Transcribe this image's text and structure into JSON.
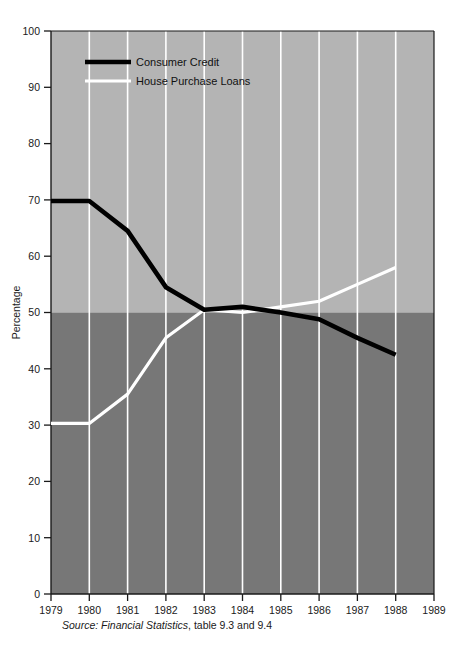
{
  "chart_data": {
    "type": "line",
    "title": "",
    "subtitle": "",
    "xlabel": "",
    "ylabel": "Percentage",
    "x": [
      1979,
      1980,
      1981,
      1982,
      1983,
      1984,
      1985,
      1986,
      1987,
      1988
    ],
    "xlim": [
      1979,
      1989
    ],
    "ylim": [
      0,
      100
    ],
    "xticks": [
      "1979",
      "1980",
      "1981",
      "1982",
      "1983",
      "1984",
      "1985",
      "1986",
      "1987",
      "1988",
      "1989"
    ],
    "yticks": [
      "0",
      "10",
      "20",
      "30",
      "40",
      "50",
      "60",
      "70",
      "80",
      "90",
      "100"
    ],
    "grid": "vertical-only",
    "legend_position": "top-left-inside",
    "series": [
      {
        "name": "Consumer Credit",
        "color": "#000000",
        "values": [
          69.8,
          69.8,
          64.5,
          54.5,
          50.5,
          51.0,
          50.0,
          48.8,
          45.5,
          42.5
        ]
      },
      {
        "name": "House Purchase Loans",
        "color": "#ffffff",
        "values": [
          30.3,
          30.3,
          35.5,
          45.5,
          50.5,
          50.0,
          51.0,
          52.0,
          55.0,
          58.0
        ]
      }
    ],
    "bands": [
      {
        "name": "upper-band",
        "from": 50,
        "to": 100,
        "color": "#b4b4b4"
      },
      {
        "name": "lower-band",
        "from": 0,
        "to": 50,
        "color": "#777777"
      }
    ],
    "annotations": {
      "source_prefix": "Source: Financial Statistics",
      "source_suffix": ", table 9.3 and 9.4"
    }
  },
  "colors": {
    "upper_band": "#b4b4b4",
    "lower_band": "#777777",
    "gridline": "#ffffff",
    "axis": "#1a1a1a",
    "consumer_credit": "#000000",
    "house_purchase_loans": "#ffffff",
    "page_background": "#ffffff"
  }
}
